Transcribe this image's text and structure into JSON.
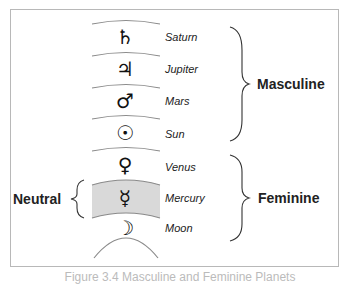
{
  "diagram": {
    "planets": [
      {
        "name": "Saturn",
        "symbol": "♄",
        "symbol_icon": "saturn-icon"
      },
      {
        "name": "Jupiter",
        "symbol": "♃",
        "symbol_icon": "jupiter-icon"
      },
      {
        "name": "Mars",
        "symbol": "♂",
        "symbol_icon": "mars-icon"
      },
      {
        "name": "Sun",
        "symbol": "☉",
        "symbol_icon": "sun-icon"
      },
      {
        "name": "Venus",
        "symbol": "♀",
        "symbol_icon": "venus-icon"
      },
      {
        "name": "Mercury",
        "symbol": "☿",
        "symbol_icon": "mercury-icon"
      },
      {
        "name": "Moon",
        "symbol": "☽",
        "symbol_icon": "moon-icon"
      }
    ],
    "groups": {
      "masculine": {
        "label": "Masculine",
        "members": [
          "Saturn",
          "Jupiter",
          "Mars",
          "Sun"
        ]
      },
      "feminine": {
        "label": "Feminine",
        "members": [
          "Venus",
          "Mercury",
          "Moon"
        ]
      },
      "neutral": {
        "label": "Neutral",
        "members": [
          "Mercury"
        ]
      }
    },
    "colors": {
      "arc": "#8a8a8a",
      "neutral_band": "#d9d9d9",
      "brace": "#333333",
      "text": "#222222",
      "frame": "#b8b8b8"
    },
    "caption": "Figure 3.4 Masculine and Feminine Planets"
  }
}
